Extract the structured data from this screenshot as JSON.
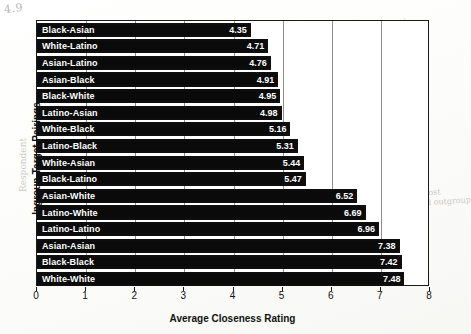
{
  "chart_data": {
    "type": "bar",
    "orientation": "horizontal",
    "title": "",
    "xlabel": "Average Closeness Rating",
    "ylabel": "Ingroup-Target Pairings",
    "xlim": [
      0,
      8
    ],
    "xticks": [
      0,
      1,
      2,
      3,
      4,
      5,
      6,
      7,
      8
    ],
    "grid": true,
    "grid_axis": "x",
    "legend": null,
    "bar_color": "#0a0a0a",
    "value_label_color": "#ffffff",
    "categories": [
      "Black-Asian",
      "White-Latino",
      "Asian-Latino",
      "Asian-Black",
      "Black-White",
      "Latino-Asian",
      "White-Black",
      "Latino-Black",
      "White-Asian",
      "Black-Latino",
      "Asian-White",
      "Latino-White",
      "Latino-Latino",
      "Asian-Asian",
      "Black-Black",
      "White-White"
    ],
    "values": [
      4.35,
      4.71,
      4.76,
      4.91,
      4.95,
      4.98,
      5.16,
      5.31,
      5.44,
      5.47,
      6.52,
      6.69,
      6.96,
      7.38,
      7.42,
      7.48
    ],
    "value_labels": [
      "4.35",
      "4.71",
      "4.76",
      "4.91",
      "4.95",
      "4.98",
      "5.16",
      "5.31",
      "5.44",
      "5.47",
      "6.52",
      "6.69",
      "6.96",
      "7.38",
      "7.42",
      "7.48"
    ]
  },
  "annotations": {
    "top_left_note": "4.9",
    "left_margin_note": "Respondent",
    "mid_right_note": "II.",
    "right_note_numeral": "II",
    "right_note_text": "whites most\npreferred outgroup",
    "bracket_ib": "Ib",
    "bracket_ia": "Ia"
  }
}
